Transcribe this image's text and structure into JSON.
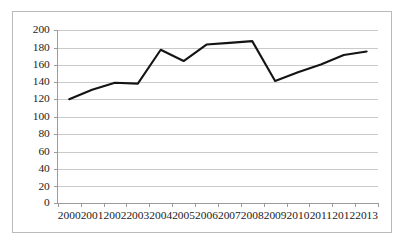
{
  "chart_data": {
    "type": "line",
    "title": "",
    "subtitle": "",
    "xlabel": "",
    "ylabel": "",
    "categories": [
      "2000",
      "2001",
      "2002",
      "2003",
      "2004",
      "2005",
      "2006",
      "2007",
      "2008",
      "2009",
      "2010",
      "2011",
      "2012",
      "2013"
    ],
    "series": [
      {
        "name": "series-1",
        "color": "#141414",
        "values": [
          120,
          131,
          139,
          138,
          177,
          164,
          183,
          185,
          187,
          141,
          151,
          160,
          171,
          175
        ]
      }
    ],
    "ylim": [
      0,
      200
    ],
    "ytick_values": [
      0,
      20,
      40,
      60,
      80,
      100,
      120,
      140,
      160,
      180,
      200
    ],
    "ytick_labels": [
      "0",
      "20",
      "40",
      "60",
      "80",
      "100",
      "120",
      "140",
      "160",
      "180",
      "200"
    ],
    "xtick_labels": [
      "2000",
      "2001",
      "2002",
      "2003",
      "2004",
      "2005",
      "2006",
      "2007",
      "2008",
      "2009",
      "2010",
      "2011",
      "2012",
      "2013"
    ],
    "grid": {
      "horizontal": true,
      "vertical": false,
      "color": "#c4c4c4"
    },
    "legend": {
      "visible": false,
      "position": "none",
      "entries": []
    },
    "markers": false,
    "plot_border": "#b9b9b9",
    "background": "#ffffff"
  }
}
